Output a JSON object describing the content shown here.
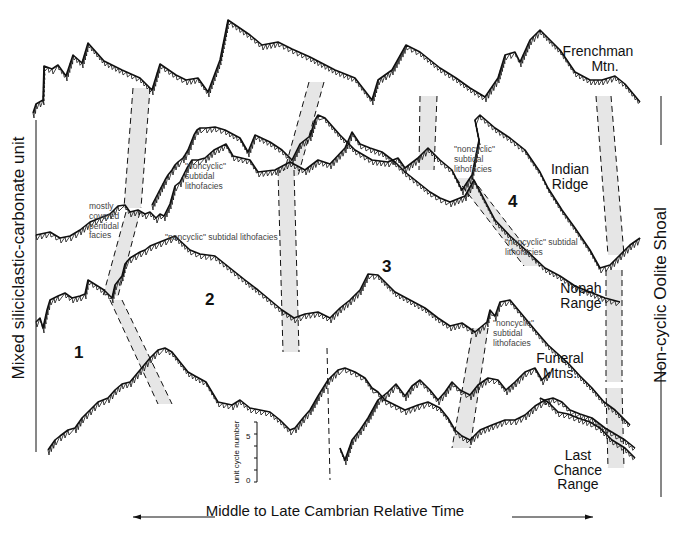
{
  "figure": {
    "type": "Fischer plot correlation diagram",
    "left_facies_label": "Mixed siliciclastic-carbonate unit",
    "right_facies_label": "Non-cyclic Oolite Shoal",
    "time_axis_label": "Middle to Late Cambrian Relative Time",
    "scale_bar": {
      "label": "unit cycle number",
      "ticks": [
        "0",
        "5"
      ]
    }
  },
  "sections": [
    {
      "name": "Frenchman Mtn.",
      "lines": [
        "Frenchman",
        "Mtn."
      ]
    },
    {
      "name": "Indian Ridge",
      "lines": [
        "Indian",
        "Ridge"
      ]
    },
    {
      "name": "Nopah Range",
      "lines": [
        "Nopah",
        "Range"
      ]
    },
    {
      "name": "Funeral Mtns.",
      "lines": [
        "Funeral",
        "Mtns."
      ]
    },
    {
      "name": "Last Chance Range",
      "lines": [
        "Last",
        "Chance",
        "Range"
      ]
    }
  ],
  "zones": [
    "1",
    "2",
    "3",
    "4"
  ],
  "annotations": {
    "mostly_covered": [
      "mostly",
      "covered",
      "peritidal",
      "facies"
    ],
    "noncyclic_a": [
      "\"noncyclic\"",
      "subtidal",
      "lithofacies"
    ],
    "noncyclic_b": "\"noncyclic\" subtidal lithofacies",
    "noncyclic_c": [
      "\"noncyclic\"",
      "subtidal",
      "lithofacies"
    ],
    "noncyclic_d": [
      "\"noncyclic\" subtidal",
      "lithofacies"
    ],
    "noncyclic_e": [
      "\"noncyclic\"",
      "subtidal",
      "lithofacies"
    ]
  },
  "colors": {
    "ink": "#111111",
    "band_fill": "#e6e6e6",
    "note_text": "#444444"
  },
  "curves": {
    "frenchman": [
      [
        33,
        113
      ],
      [
        36,
        104
      ],
      [
        43,
        100
      ],
      [
        44,
        66
      ],
      [
        52,
        69
      ],
      [
        58,
        65
      ],
      [
        66,
        76
      ],
      [
        73,
        55
      ],
      [
        82,
        63
      ],
      [
        88,
        43
      ],
      [
        104,
        61
      ],
      [
        122,
        70
      ],
      [
        140,
        78
      ],
      [
        152,
        90
      ],
      [
        160,
        64
      ],
      [
        176,
        75
      ],
      [
        186,
        80
      ],
      [
        198,
        78
      ],
      [
        208,
        92
      ],
      [
        220,
        60
      ],
      [
        228,
        20
      ],
      [
        250,
        35
      ],
      [
        262,
        45
      ],
      [
        278,
        42
      ],
      [
        292,
        49
      ],
      [
        310,
        57
      ],
      [
        335,
        70
      ],
      [
        355,
        78
      ],
      [
        372,
        100
      ],
      [
        378,
        80
      ],
      [
        392,
        70
      ],
      [
        406,
        45
      ],
      [
        420,
        52
      ],
      [
        440,
        68
      ],
      [
        456,
        78
      ],
      [
        470,
        88
      ],
      [
        485,
        97
      ],
      [
        498,
        78
      ],
      [
        505,
        55
      ],
      [
        515,
        52
      ],
      [
        520,
        62
      ],
      [
        530,
        40
      ],
      [
        540,
        30
      ],
      [
        560,
        50
      ],
      [
        575,
        72
      ],
      [
        590,
        80
      ],
      [
        602,
        80
      ],
      [
        615,
        76
      ],
      [
        625,
        84
      ],
      [
        640,
        102
      ]
    ],
    "indian": [
      [
        152,
        205
      ],
      [
        165,
        180
      ],
      [
        168,
        175
      ],
      [
        172,
        170
      ],
      [
        175,
        165
      ],
      [
        178,
        162
      ],
      [
        183,
        158
      ],
      [
        185,
        155
      ],
      [
        188,
        150
      ],
      [
        192,
        140
      ],
      [
        194,
        135
      ],
      [
        197,
        130
      ],
      [
        200,
        128
      ],
      [
        206,
        128
      ],
      [
        215,
        127
      ],
      [
        225,
        130
      ],
      [
        240,
        138
      ],
      [
        248,
        152
      ],
      [
        255,
        135
      ],
      [
        270,
        142
      ],
      [
        282,
        150
      ],
      [
        292,
        160
      ],
      [
        300,
        144
      ],
      [
        310,
        136
      ],
      [
        315,
        120
      ],
      [
        318,
        115
      ],
      [
        325,
        118
      ],
      [
        340,
        135
      ],
      [
        355,
        150
      ],
      [
        372,
        160
      ],
      [
        388,
        162
      ],
      [
        398,
        158
      ],
      [
        405,
        168
      ],
      [
        418,
        158
      ],
      [
        428,
        148
      ],
      [
        440,
        160
      ],
      [
        452,
        170
      ],
      [
        462,
        190
      ],
      [
        472,
        175
      ],
      [
        479,
        140
      ],
      [
        475,
        120
      ],
      [
        480,
        115
      ],
      [
        495,
        128
      ],
      [
        510,
        138
      ],
      [
        525,
        150
      ],
      [
        540,
        172
      ],
      [
        548,
        188
      ],
      [
        562,
        210
      ],
      [
        575,
        228
      ],
      [
        590,
        250
      ],
      [
        600,
        268
      ],
      [
        610,
        265
      ],
      [
        620,
        255
      ],
      [
        630,
        245
      ],
      [
        640,
        238
      ]
    ],
    "nopah": [
      [
        36,
        235
      ],
      [
        50,
        232
      ],
      [
        60,
        238
      ],
      [
        70,
        236
      ],
      [
        80,
        230
      ],
      [
        90,
        222
      ],
      [
        100,
        218
      ],
      [
        110,
        214
      ],
      [
        118,
        206
      ],
      [
        125,
        205
      ],
      [
        130,
        212
      ],
      [
        138,
        210
      ],
      [
        145,
        214
      ],
      [
        150,
        212
      ],
      [
        156,
        218
      ],
      [
        160,
        214
      ],
      [
        164,
        216
      ],
      [
        170,
        204
      ],
      [
        175,
        186
      ],
      [
        180,
        182
      ],
      [
        187,
        168
      ],
      [
        192,
        160
      ],
      [
        198,
        160
      ],
      [
        205,
        158
      ],
      [
        214,
        150
      ],
      [
        226,
        144
      ],
      [
        233,
        156
      ],
      [
        250,
        160
      ],
      [
        258,
        172
      ],
      [
        275,
        170
      ],
      [
        290,
        162
      ],
      [
        305,
        170
      ],
      [
        318,
        160
      ],
      [
        330,
        164
      ],
      [
        345,
        148
      ],
      [
        352,
        132
      ],
      [
        360,
        144
      ],
      [
        370,
        148
      ],
      [
        382,
        152
      ],
      [
        395,
        162
      ],
      [
        405,
        172
      ],
      [
        420,
        184
      ],
      [
        430,
        192
      ],
      [
        440,
        198
      ],
      [
        450,
        202
      ],
      [
        465,
        196
      ],
      [
        474,
        180
      ],
      [
        495,
        220
      ],
      [
        510,
        236
      ],
      [
        528,
        252
      ],
      [
        545,
        268
      ],
      [
        560,
        276
      ],
      [
        575,
        286
      ],
      [
        590,
        292
      ],
      [
        605,
        298
      ],
      [
        620,
        302
      ]
    ],
    "funeral": [
      [
        36,
        322
      ],
      [
        40,
        318
      ],
      [
        43,
        328
      ],
      [
        47,
        310
      ],
      [
        50,
        300
      ],
      [
        58,
        296
      ],
      [
        65,
        293
      ],
      [
        72,
        298
      ],
      [
        80,
        296
      ],
      [
        85,
        294
      ],
      [
        88,
        280
      ],
      [
        104,
        290
      ],
      [
        112,
        298
      ],
      [
        115,
        285
      ],
      [
        122,
        276
      ],
      [
        125,
        264
      ],
      [
        130,
        258
      ],
      [
        140,
        252
      ],
      [
        145,
        250
      ],
      [
        150,
        246
      ],
      [
        160,
        242
      ],
      [
        165,
        240
      ],
      [
        175,
        236
      ],
      [
        190,
        250
      ],
      [
        200,
        254
      ],
      [
        215,
        256
      ],
      [
        230,
        268
      ],
      [
        245,
        280
      ],
      [
        258,
        290
      ],
      [
        270,
        300
      ],
      [
        282,
        310
      ],
      [
        294,
        318
      ],
      [
        305,
        314
      ],
      [
        318,
        312
      ],
      [
        330,
        318
      ],
      [
        340,
        308
      ],
      [
        350,
        300
      ],
      [
        360,
        290
      ],
      [
        368,
        274
      ],
      [
        378,
        275
      ],
      [
        395,
        292
      ],
      [
        410,
        300
      ],
      [
        425,
        308
      ],
      [
        438,
        318
      ],
      [
        450,
        326
      ],
      [
        462,
        323
      ],
      [
        475,
        332
      ],
      [
        487,
        322
      ],
      [
        490,
        310
      ],
      [
        495,
        316
      ],
      [
        500,
        302
      ],
      [
        510,
        300
      ],
      [
        520,
        312
      ],
      [
        535,
        330
      ],
      [
        548,
        345
      ],
      [
        558,
        354
      ],
      [
        568,
        363
      ],
      [
        580,
        376
      ],
      [
        592,
        388
      ],
      [
        604,
        402
      ],
      [
        615,
        410
      ],
      [
        630,
        425
      ]
    ],
    "lastchance": [
      [
        48,
        450
      ],
      [
        55,
        440
      ],
      [
        60,
        436
      ],
      [
        68,
        430
      ],
      [
        75,
        428
      ],
      [
        82,
        418
      ],
      [
        90,
        410
      ],
      [
        98,
        402
      ],
      [
        108,
        398
      ],
      [
        115,
        390
      ],
      [
        122,
        384
      ],
      [
        130,
        382
      ],
      [
        140,
        370
      ],
      [
        150,
        358
      ],
      [
        158,
        350
      ],
      [
        165,
        348
      ],
      [
        172,
        352
      ],
      [
        180,
        362
      ],
      [
        188,
        372
      ],
      [
        195,
        376
      ],
      [
        206,
        382
      ],
      [
        218,
        402
      ],
      [
        232,
        405
      ],
      [
        240,
        400
      ],
      [
        250,
        408
      ],
      [
        260,
        410
      ],
      [
        270,
        412
      ],
      [
        280,
        420
      ],
      [
        290,
        430
      ],
      [
        295,
        428
      ],
      [
        303,
        418
      ],
      [
        310,
        410
      ],
      [
        318,
        396
      ],
      [
        328,
        380
      ],
      [
        338,
        370
      ],
      [
        345,
        368
      ],
      [
        355,
        372
      ],
      [
        365,
        378
      ],
      [
        372,
        388
      ],
      [
        378,
        392
      ],
      [
        385,
        400
      ],
      [
        395,
        405
      ],
      [
        405,
        410
      ],
      [
        418,
        405
      ],
      [
        428,
        402
      ],
      [
        440,
        408
      ],
      [
        448,
        418
      ],
      [
        455,
        430
      ],
      [
        462,
        436
      ],
      [
        470,
        440
      ],
      [
        480,
        430
      ],
      [
        492,
        425
      ],
      [
        505,
        420
      ],
      [
        515,
        420
      ],
      [
        525,
        415
      ],
      [
        535,
        406
      ],
      [
        545,
        400
      ],
      [
        553,
        398
      ],
      [
        562,
        402
      ],
      [
        570,
        410
      ],
      [
        580,
        414
      ],
      [
        592,
        418
      ],
      [
        605,
        428
      ],
      [
        615,
        434
      ],
      [
        625,
        440
      ],
      [
        635,
        448
      ]
    ],
    "lc_part2": [
      [
        340,
        448
      ],
      [
        345,
        460
      ],
      [
        352,
        440
      ],
      [
        360,
        430
      ],
      [
        368,
        418
      ],
      [
        378,
        400
      ],
      [
        388,
        392
      ],
      [
        396,
        384
      ],
      [
        405,
        396
      ],
      [
        412,
        386
      ],
      [
        420,
        380
      ],
      [
        430,
        390
      ],
      [
        438,
        400
      ],
      [
        445,
        392
      ],
      [
        452,
        382
      ],
      [
        460,
        390
      ],
      [
        470,
        395
      ],
      [
        478,
        385
      ],
      [
        488,
        378
      ],
      [
        498,
        380
      ],
      [
        506,
        390
      ],
      [
        515,
        382
      ],
      [
        525,
        372
      ],
      [
        535,
        368
      ],
      [
        542,
        380
      ],
      [
        550,
        372
      ]
    ],
    "lc_part3": [
      [
        540,
        398
      ],
      [
        548,
        402
      ],
      [
        558,
        412
      ],
      [
        568,
        414
      ],
      [
        578,
        418
      ],
      [
        590,
        422
      ],
      [
        600,
        428
      ],
      [
        612,
        440
      ],
      [
        625,
        448
      ],
      [
        635,
        458
      ]
    ]
  },
  "correlation_bands": [
    {
      "points": [
        [
          133,
          88
        ],
        [
          150,
          88
        ],
        [
          141,
          208
        ],
        [
          124,
          208
        ]
      ]
    },
    {
      "points": [
        [
          309,
          82
        ],
        [
          324,
          82
        ],
        [
          298,
          176
        ],
        [
          283,
          176
        ]
      ]
    },
    {
      "points": [
        [
          420,
          96
        ],
        [
          437,
          96
        ],
        [
          434,
          170
        ],
        [
          419,
          170
        ]
      ]
    },
    {
      "points": [
        [
          596,
          96
        ],
        [
          611,
          96
        ],
        [
          624,
          255
        ],
        [
          608,
          255
        ]
      ]
    },
    {
      "points": [
        [
          126,
          212
        ],
        [
          140,
          212
        ],
        [
          118,
          296
        ],
        [
          103,
          296
        ]
      ]
    },
    {
      "points": [
        [
          278,
          170
        ],
        [
          294,
          170
        ],
        [
          299,
          352
        ],
        [
          283,
          352
        ]
      ]
    },
    {
      "points": [
        [
          456,
          178
        ],
        [
          472,
          178
        ],
        [
          540,
          266
        ],
        [
          524,
          266
        ]
      ]
    },
    {
      "points": [
        [
          606,
          270
        ],
        [
          622,
          270
        ],
        [
          622,
          382
        ],
        [
          606,
          382
        ]
      ]
    },
    {
      "points": [
        [
          110,
          300
        ],
        [
          122,
          300
        ],
        [
          172,
          404
        ],
        [
          158,
          404
        ]
      ]
    },
    {
      "points": [
        [
          473,
          328
        ],
        [
          488,
          328
        ],
        [
          470,
          448
        ],
        [
          452,
          448
        ]
      ]
    },
    {
      "points": [
        [
          606,
          388
        ],
        [
          622,
          388
        ],
        [
          624,
          468
        ],
        [
          608,
          468
        ]
      ]
    }
  ],
  "dashed_lines": [
    [
      [
        327,
        348
      ],
      [
        330,
        480
      ]
    ]
  ]
}
